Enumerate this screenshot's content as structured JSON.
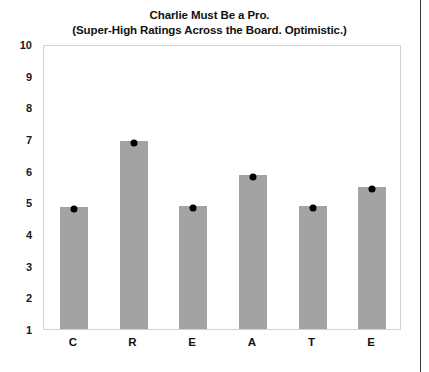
{
  "chart_data": {
    "type": "bar",
    "title": "Charlie Must Be a Pro.",
    "subtitle": "(Super-High Ratings Across the Board. Optimistic.)",
    "categories": [
      "C",
      "R",
      "E",
      "A",
      "T",
      "E"
    ],
    "values": [
      4.85,
      6.95,
      4.9,
      5.85,
      4.9,
      5.5
    ],
    "series": [
      {
        "name": "rating",
        "values": [
          4.85,
          6.95,
          4.9,
          5.85,
          4.9,
          5.5
        ]
      }
    ],
    "xlabel": "",
    "ylabel": "",
    "ylim": [
      1,
      10
    ],
    "yticks": [
      1,
      2,
      3,
      4,
      5,
      6,
      7,
      8,
      9,
      10
    ],
    "ytick_labels": [
      "1",
      "2",
      "3",
      "4",
      "5",
      "6",
      "7",
      "8",
      "9",
      "10"
    ],
    "grid": false,
    "legend": false,
    "legend_position": "none",
    "markers": "black-dot-at-bar-top",
    "colors": {
      "bar_fill": "#a3a3a3",
      "marker": "#000000",
      "frame_border": "#d2d2d2",
      "text": "#111111",
      "background": "#ffffff",
      "page_edge": "#3a3a3a"
    }
  }
}
